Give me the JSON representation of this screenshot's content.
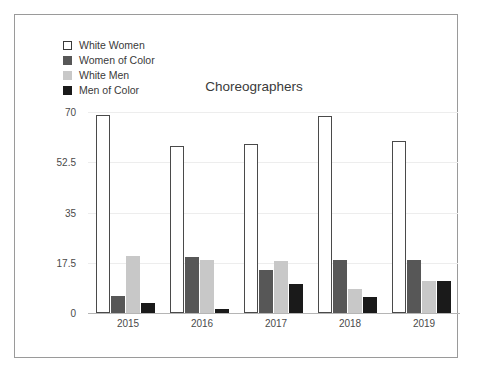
{
  "chart_data": {
    "type": "bar",
    "title": "Choreographers",
    "xlabel": "",
    "ylabel": "",
    "categories": [
      "2015",
      "2016",
      "2017",
      "2018",
      "2019"
    ],
    "ylim": [
      0,
      70
    ],
    "yticks": [
      "0",
      "17.5",
      "35",
      "52.5",
      "70"
    ],
    "ytick_values": [
      0,
      17.5,
      35,
      52.5,
      70
    ],
    "grid": true,
    "legend_position": "top-left",
    "series": [
      {
        "name": "White Women",
        "color": "#ffffff",
        "border": "#4a4a4a",
        "values": [
          69,
          58,
          59,
          68.5,
          60
        ]
      },
      {
        "name": "Women of Color",
        "color": "#575757",
        "border": "#575757",
        "values": [
          6,
          19.5,
          15,
          18.5,
          18.5
        ]
      },
      {
        "name": "White Men",
        "color": "#c8c8c8",
        "border": "#c8c8c8",
        "values": [
          20,
          18.5,
          18,
          8.5,
          11
        ]
      },
      {
        "name": "Men of Color",
        "color": "#1a1a1a",
        "border": "#1a1a1a",
        "values": [
          3.5,
          1.5,
          10,
          5.5,
          11
        ]
      }
    ]
  }
}
